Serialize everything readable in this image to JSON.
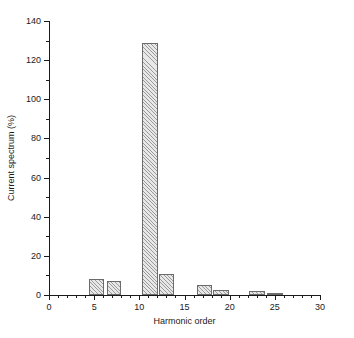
{
  "chart_data": {
    "type": "bar",
    "title": "",
    "xlabel": "Harmonic order",
    "ylabel": "Current spectrum (%)",
    "xlim": [
      0,
      30
    ],
    "ylim": [
      0,
      140
    ],
    "grid": false,
    "legend": null,
    "xticks": [
      0,
      5,
      10,
      15,
      20,
      25,
      30
    ],
    "xticklabels": [
      "0",
      "5",
      "10",
      "15",
      "20",
      "25",
      "30"
    ],
    "xminor_interval": 1,
    "yticks": [
      0,
      20,
      40,
      60,
      80,
      100,
      120,
      140
    ],
    "yticklabels": [
      "0",
      "20",
      "40",
      "60",
      "80",
      "100",
      "120",
      "140"
    ],
    "yminor_interval": 10,
    "bar_style": {
      "fill": "#e8e8e8",
      "hatch": "diagonal-lines",
      "hatch_color": "#9a9a9a",
      "edge": "#6b6b6b"
    },
    "bars": [
      {
        "label": "5",
        "x_start": 4.45,
        "x_end": 6.05,
        "value": 8.2
      },
      {
        "label": "7",
        "x_start": 6.45,
        "x_end": 7.95,
        "value": 7.1
      },
      {
        "label": "11",
        "x_start": 10.35,
        "x_end": 12.05,
        "value": 128.8
      },
      {
        "label": "13",
        "x_start": 12.15,
        "x_end": 13.85,
        "value": 10.7
      },
      {
        "label": "17",
        "x_start": 16.35,
        "x_end": 18.05,
        "value": 4.9
      },
      {
        "label": "19",
        "x_start": 18.15,
        "x_end": 19.95,
        "value": 2.4
      },
      {
        "label": "23",
        "x_start": 22.15,
        "x_end": 23.95,
        "value": 1.9
      },
      {
        "label": "25",
        "x_start": 24.15,
        "x_end": 25.95,
        "value": 0.9
      }
    ],
    "categories": [
      5,
      7,
      11,
      13,
      17,
      19,
      23,
      25
    ],
    "values": [
      8.2,
      7.1,
      128.8,
      10.7,
      4.9,
      2.4,
      1.9,
      0.9
    ]
  },
  "axis": {
    "x_title": "Harmonic order",
    "y_title": "Current spectrum (%)"
  },
  "colors": {
    "ink": "#1a1a1a",
    "bar_fill": "#e8e8e8",
    "bar_edge": "#6b6b6b",
    "hatch": "#9a9a9a"
  }
}
